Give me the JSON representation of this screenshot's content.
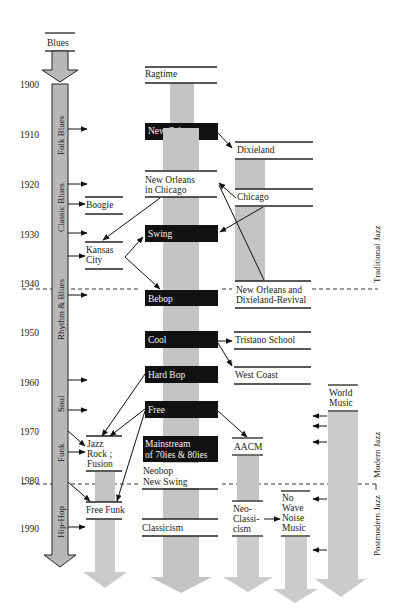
{
  "years": [
    "1900",
    "1910",
    "1920",
    "1930",
    "1940",
    "1950",
    "1960",
    "1970",
    "1980",
    "1990"
  ],
  "blues_column": {
    "source": "Blues",
    "segments": [
      "Folk Blues",
      "Classic Blues",
      "Rhythm & Blues",
      "Soul",
      "Funk",
      "Hip-Hop"
    ]
  },
  "styles": {
    "ragtime": "Ragtime",
    "new_orleans": "New Orleans",
    "dixieland": "Dixieland",
    "new_orleans_chicago_1": "New Orleans",
    "new_orleans_chicago_2": "in Chicago",
    "chicago": "Chicago",
    "boogie": "Boogie",
    "kansas_city_1": "Kansas",
    "kansas_city_2": "City",
    "swing": "Swing",
    "bebop": "Bebop",
    "revival_1": "New Orleans and",
    "revival_2": "Dixieland-Revival",
    "cool": "Cool",
    "tristano": "Tristano School",
    "west_coast": "West Coast",
    "hard_bop": "Hard Bop",
    "free": "Free",
    "world_music_1": "World",
    "world_music_2": "Music",
    "jazz_rock_1": "Jazz",
    "jazz_rock_2": "Rock ;",
    "jazz_rock_3": "Fusion",
    "mainstream_1": "Mainstream",
    "mainstream_2": "of 70ies & 80ies",
    "aacm": "AACM",
    "neobop_1": "Neobop",
    "neobop_2": "New Swing",
    "free_funk": "Free Funk",
    "classicism": "Classicism",
    "neoclassicism_1": "Neo-",
    "neoclassicism_2": "Classi-",
    "neoclassicism_3": "cism",
    "nowave_1": "No",
    "nowave_2": "Wave",
    "nowave_3": "Noise",
    "nowave_4": "Music"
  },
  "eras": {
    "traditional": "Traditional Jazz",
    "modern": "Modern Jazz",
    "postmodern": "Postmodern Jazz"
  },
  "colors": {
    "bar": "#c4c4c4",
    "highlight_box": "#111111",
    "highlight_text": "#f2f2f2"
  }
}
